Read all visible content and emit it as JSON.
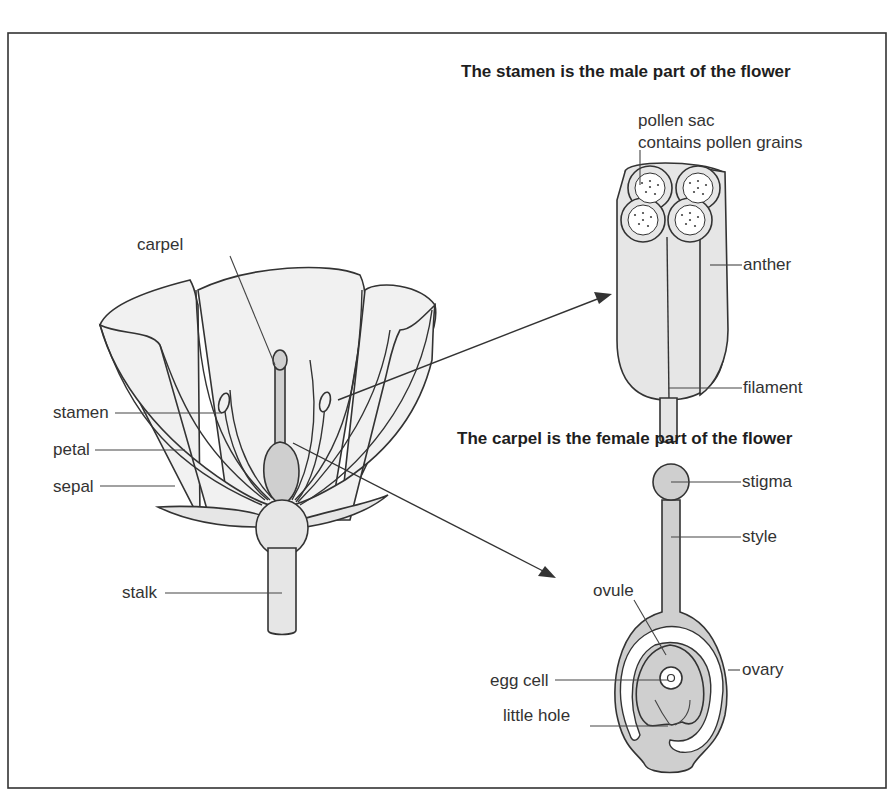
{
  "frame": {
    "border_color": "#333333",
    "background": "#ffffff"
  },
  "colors": {
    "tissue_light": "#e6e6e6",
    "tissue_grey": "#cfcfcf",
    "petal_fill": "#f1f1f1",
    "line": "#333333"
  },
  "flower": {
    "labels": {
      "carpel": "carpel",
      "stamen": "stamen",
      "petal": "petal",
      "sepal": "sepal",
      "stalk": "stalk"
    }
  },
  "stamen_detail": {
    "title": "The stamen is the male part of the flower",
    "labels": {
      "pollen_sac_line1": "pollen sac",
      "pollen_sac_line2": "contains pollen grains",
      "anther": "anther",
      "filament": "filament"
    }
  },
  "carpel_detail": {
    "title": "The carpel is the female part of the flower",
    "labels": {
      "stigma": "stigma",
      "style": "style",
      "ovule": "ovule",
      "egg_cell": "egg cell",
      "ovary": "ovary",
      "little_hole": "little hole"
    }
  }
}
